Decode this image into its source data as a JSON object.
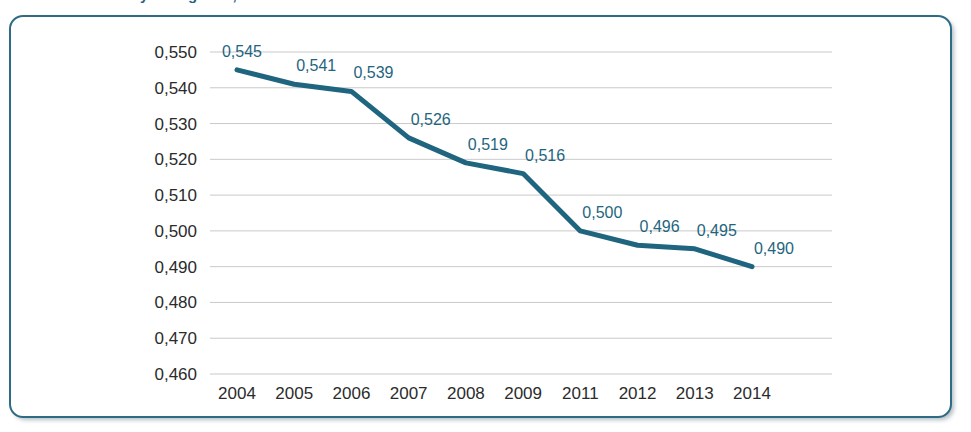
{
  "title_fragment": "Grafik 1. Gini katsayisi degisimi, 2004-2014",
  "colors": {
    "line": "#1F6580",
    "frame": "#2E6C85",
    "gridline": "#c9c9c9",
    "axis_text": "#2b2b2b",
    "data_label": "#1F6580",
    "background": "#ffffff"
  },
  "chart_data": {
    "type": "line",
    "title": "",
    "xlabel": "",
    "ylabel": "",
    "categories": [
      "2004",
      "2005",
      "2006",
      "2007",
      "2008",
      "2009",
      "2011",
      "2012",
      "2013",
      "2014"
    ],
    "values": [
      0.545,
      0.541,
      0.539,
      0.526,
      0.519,
      0.516,
      0.5,
      0.496,
      0.495,
      0.49
    ],
    "point_labels": [
      "0,545",
      "0,541",
      "0,539",
      "0,526",
      "0,519",
      "0,516",
      "0,500",
      "0,496",
      "0,495",
      "0,490"
    ],
    "ylim": [
      0.46,
      0.55
    ],
    "ytick_step": 0.01,
    "ytick_labels": [
      "0,550",
      "0,540",
      "0,530",
      "0,520",
      "0,510",
      "0,500",
      "0,490",
      "0,480",
      "0,470",
      "0,460"
    ],
    "ytick_values": [
      0.55,
      0.54,
      0.53,
      0.52,
      0.51,
      0.5,
      0.49,
      0.48,
      0.47,
      0.46
    ],
    "grid": "horizontal",
    "legend": "none",
    "decimal_separator": ",",
    "series": [
      {
        "name": "",
        "values": [
          0.545,
          0.541,
          0.539,
          0.526,
          0.519,
          0.516,
          0.5,
          0.496,
          0.495,
          0.49
        ]
      }
    ]
  }
}
